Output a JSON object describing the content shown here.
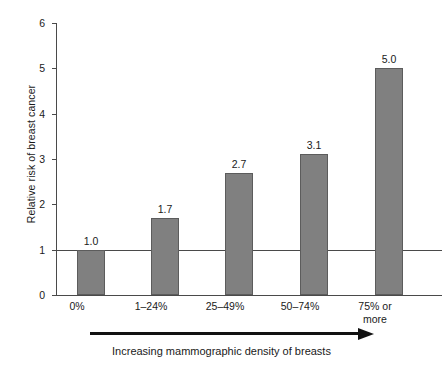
{
  "chart_data": {
    "type": "bar",
    "title": "",
    "xlabel": "Increasing mammographic density of breasts",
    "ylabel": "Relative risk of breast cancer",
    "categories": [
      "0%",
      "1–24%",
      "25–49%",
      "50–74%",
      "75% or\nmore"
    ],
    "values": [
      1.0,
      1.7,
      2.7,
      3.1,
      5.0
    ],
    "data_labels": [
      "1.0",
      "1.7",
      "2.7",
      "3.1",
      "5.0"
    ],
    "ylim": [
      0,
      6
    ],
    "yticks": [
      0,
      1,
      2,
      3,
      4,
      5,
      6
    ],
    "ytick_labels": [
      "0",
      "1",
      "2",
      "3",
      "4",
      "5",
      "6"
    ],
    "grid": false,
    "reference_line": 1,
    "legend": "none",
    "bar_color": "#808080",
    "bar_edge_color": "#5c5c5c",
    "axis_color": "#4a4a4a",
    "text_color": "#1a1a1a"
  },
  "axis": {
    "y_title": "Relative risk of breast cancer",
    "ticks": [
      {
        "label": "6",
        "value": 6
      },
      {
        "label": "5",
        "value": 5
      },
      {
        "label": "4",
        "value": 4
      },
      {
        "label": "3",
        "value": 3
      },
      {
        "label": "2",
        "value": 2
      },
      {
        "label": "1",
        "value": 1
      },
      {
        "label": "0",
        "value": 0
      }
    ]
  },
  "bars": [
    {
      "category": "0%",
      "line1": "0%",
      "line2": "",
      "value": 1.0,
      "label": "1.0"
    },
    {
      "category": "1–24%",
      "line1": "1–24%",
      "line2": "",
      "value": 1.7,
      "label": "1.7"
    },
    {
      "category": "25–49%",
      "line1": "25–49%",
      "line2": "",
      "value": 2.7,
      "label": "2.7"
    },
    {
      "category": "50–74%",
      "line1": "50–74%",
      "line2": "",
      "value": 3.1,
      "label": "3.1"
    },
    {
      "category": "75% or more",
      "line1": "75% or",
      "line2": "more",
      "value": 5.0,
      "label": "5.0"
    }
  ],
  "annotation": {
    "arrow_direction": "right",
    "caption": "Increasing mammographic density of breasts"
  }
}
